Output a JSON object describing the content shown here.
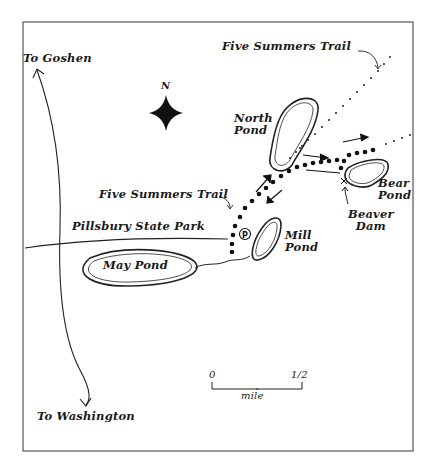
{
  "map": {
    "title": "Pillsbury State Park trail map",
    "compass": {
      "label": "N"
    },
    "labels": {
      "to_goshen": "To Goshen",
      "to_washington": "To Washington",
      "five_summers_trail_top": "Five Summers Trail",
      "five_summers_trail_mid": "Five Summers Trail",
      "north_pond_line1": "North",
      "north_pond_line2": "Pond",
      "pillsbury_state_park": "Pillsbury State Park",
      "mill_pond_line1": "Mill",
      "mill_pond_line2": "Pond",
      "may_pond": "May Pond",
      "bear_pond_line1": "Bear",
      "bear_pond_line2": "Pond",
      "beaver_dam_line1": "Beaver",
      "beaver_dam_line2": "Dam",
      "parking_symbol": "P",
      "dam_symbol": "x"
    },
    "scale_bar": {
      "start": "0",
      "end": "1/2",
      "unit": "mile"
    },
    "colors": {
      "ink": "#1a1a1a",
      "background": "#ffffff",
      "frame": "#555555"
    }
  }
}
